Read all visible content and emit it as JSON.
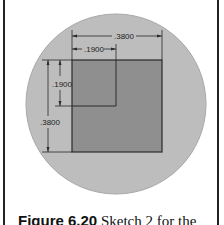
{
  "figure": {
    "caption_label": "Figure 6.20",
    "caption_text": " Sketch 2 for the",
    "colors": {
      "circle": "#bdbdbd",
      "rectangle": "#8f8f8f",
      "lines": "#2a2a2a"
    },
    "dimensions": {
      "top_width": ".3800",
      "top_inner_width": ".1900",
      "left_inner_height": ".1900",
      "left_height": ".3800"
    }
  }
}
